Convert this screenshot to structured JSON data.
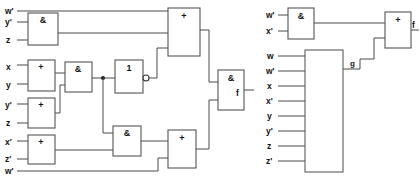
{
  "figure": {
    "type": "logic-circuit-diagram",
    "count": 2,
    "background_color": "#ffffff",
    "wire_color": "#4a4a4a",
    "gate_outline_color": "#555555"
  },
  "left_circuit": {
    "name": "left-circuit",
    "output_label": "f",
    "inputs": [
      {
        "id": "in-w-prime-top",
        "label": "w'"
      },
      {
        "id": "in-y-prime-1",
        "label": "y'"
      },
      {
        "id": "in-z-1",
        "label": "z"
      },
      {
        "id": "in-x",
        "label": "x"
      },
      {
        "id": "in-y",
        "label": "y"
      },
      {
        "id": "in-y-prime-2",
        "label": "y'"
      },
      {
        "id": "in-z-2",
        "label": "z"
      },
      {
        "id": "in-x-prime",
        "label": "x'"
      },
      {
        "id": "in-z-prime",
        "label": "z'"
      },
      {
        "id": "in-w-prime-bottom",
        "label": "w'"
      }
    ],
    "gates": [
      {
        "id": "and-1",
        "symbol": "&",
        "name": "and-gate-yprime-z"
      },
      {
        "id": "or-1",
        "symbol": "+",
        "name": "or-gate-x-y"
      },
      {
        "id": "or-2",
        "symbol": "+",
        "name": "or-gate-yprime-z"
      },
      {
        "id": "or-3",
        "symbol": "+",
        "name": "or-gate-xprime-zprime"
      },
      {
        "id": "and-2",
        "symbol": "&",
        "name": "and-gate-middle"
      },
      {
        "id": "not-1",
        "symbol": "1",
        "name": "inverter-gate",
        "inverting_output": true
      },
      {
        "id": "and-3",
        "symbol": "&",
        "name": "and-gate-lower"
      },
      {
        "id": "or-4",
        "symbol": "+",
        "name": "or-gate-top"
      },
      {
        "id": "or-5",
        "symbol": "+",
        "name": "or-gate-bottom"
      },
      {
        "id": "and-4",
        "symbol": "&",
        "name": "and-gate-output"
      }
    ]
  },
  "right_circuit": {
    "name": "right-circuit",
    "output_label": "f",
    "intermediate_label": "g",
    "and_gate": {
      "symbol": "&",
      "name": "and-gate-wprime-xprime"
    },
    "or_gate": {
      "symbol": "+",
      "name": "or-gate-output"
    },
    "and_inputs": [
      {
        "id": "r-in-w-prime",
        "label": "w'"
      },
      {
        "id": "r-in-x-prime",
        "label": "x'"
      }
    ],
    "block": {
      "name": "logic-block",
      "symbol": "",
      "inputs": [
        {
          "id": "b-in-w",
          "label": "w"
        },
        {
          "id": "b-in-w-prime",
          "label": "w'"
        },
        {
          "id": "b-in-x",
          "label": "x"
        },
        {
          "id": "b-in-x-prime",
          "label": "x'"
        },
        {
          "id": "b-in-y",
          "label": "y"
        },
        {
          "id": "b-in-y-prime",
          "label": "y'"
        },
        {
          "id": "b-in-z",
          "label": "z"
        },
        {
          "id": "b-in-z-prime",
          "label": "z'"
        }
      ]
    }
  }
}
